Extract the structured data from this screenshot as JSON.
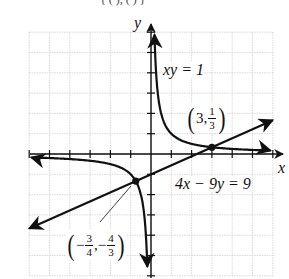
{
  "chart_data": {
    "type": "line",
    "title": "",
    "xlabel": "x",
    "ylabel": "y",
    "xlim": [
      -6,
      6
    ],
    "ylim": [
      -6,
      6
    ],
    "grid": true,
    "tick_step": 1,
    "series": [
      {
        "name": "xy = 1",
        "kind": "hyperbola",
        "equation": "xy = 1",
        "points": [
          [
            -6,
            -0.1667
          ],
          [
            -4,
            -0.25
          ],
          [
            -3,
            -0.3333
          ],
          [
            -2,
            -0.5
          ],
          [
            -1,
            -1
          ],
          [
            -0.75,
            -1.3333
          ],
          [
            -0.5,
            -2
          ],
          [
            -0.3333,
            -3
          ],
          [
            -0.25,
            -4
          ],
          [
            -0.1667,
            -6
          ],
          [
            0.1667,
            6
          ],
          [
            0.25,
            4
          ],
          [
            0.3333,
            3
          ],
          [
            0.5,
            2
          ],
          [
            1,
            1
          ],
          [
            2,
            0.5
          ],
          [
            3,
            0.3333
          ],
          [
            4,
            0.25
          ],
          [
            6,
            0.1667
          ]
        ]
      },
      {
        "name": "4x - 9y = 9",
        "kind": "line",
        "equation": "4x − 9y = 9",
        "points": [
          [
            -6,
            -3.6667
          ],
          [
            6,
            1.6667
          ]
        ]
      }
    ],
    "annotations": [
      {
        "label_whole": "3",
        "label_num": "1",
        "label_den": "3",
        "x": 3,
        "y": 0.3333,
        "text": "(3, 1/3)"
      },
      {
        "label_xnum": "3",
        "label_xden": "4",
        "label_ynum": "4",
        "label_yden": "3",
        "x": -0.75,
        "y": -1.3333,
        "text": "(−3/4, −4/3)"
      }
    ]
  },
  "labels": {
    "x_axis": "x",
    "y_axis": "y",
    "hyperbola_eq": "xy = 1",
    "line_eq": "4x − 9y = 9",
    "point1": {
      "open": "(",
      "x": "3,",
      "y_num": "1",
      "y_den": "3",
      "close": ")"
    },
    "point2": {
      "open": "(",
      "x_sign": "−",
      "x_num": "3",
      "x_den": "4",
      "comma": ",",
      "y_sign": "−",
      "y_num": "4",
      "y_den": "3",
      "close": ")"
    }
  },
  "colors": {
    "grid": "#c8c8c8",
    "axis": "#111111",
    "curve": "#111111"
  }
}
